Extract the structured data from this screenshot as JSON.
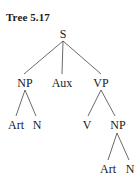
{
  "title": "Tree 5.17",
  "tree": {
    "root": "S",
    "nodes": {
      "s": "S",
      "np1": "NP",
      "aux": "Aux",
      "vp": "VP",
      "art1": "Art",
      "n1": "N",
      "v": "V",
      "np2": "NP",
      "art2": "Art",
      "n2": "N"
    },
    "structure": "[S [NP [Art] [N]] [Aux] [VP [V] [NP [Art] [N]]]]"
  },
  "colors": {
    "text": "#1a1a1a",
    "lines": "#444444",
    "background": "#ffffff"
  }
}
